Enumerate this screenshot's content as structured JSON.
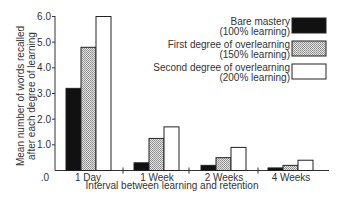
{
  "chart_data": {
    "type": "bar",
    "title": "",
    "xlabel": "Interval between learning and retention",
    "ylabel": [
      "Mean number of words recalled",
      "after each degree of learning"
    ],
    "ylim": [
      0,
      6.0
    ],
    "yticks": [
      ".0",
      "1.0",
      "2.0",
      "3.0",
      "4.0",
      "5.0",
      "6.0"
    ],
    "categories": [
      "1 Day",
      "1 Week",
      "2 Weeks",
      "4 Weeks"
    ],
    "series": [
      {
        "name": "Bare mastery (100% learning)",
        "label_lines": [
          "Bare mastery",
          "(100% learning)"
        ],
        "pattern": "solid-black",
        "color": "#111111",
        "values": [
          3.2,
          0.3,
          0.2,
          0.1
        ]
      },
      {
        "name": "First degree of overlearning (150% learning)",
        "label_lines": [
          "First degree of overlearning",
          "(150% learning)"
        ],
        "pattern": "stipple-gray",
        "color": "#c8c8c8",
        "values": [
          4.8,
          1.25,
          0.5,
          0.2
        ]
      },
      {
        "name": "Second degree of overlearning (200% learning)",
        "label_lines": [
          "Second degree of overlearning",
          "(200% learning)"
        ],
        "pattern": "white",
        "color": "#ffffff",
        "values": [
          6.0,
          1.7,
          0.9,
          0.4
        ]
      }
    ],
    "legend_position": "upper-right",
    "grid": false
  }
}
